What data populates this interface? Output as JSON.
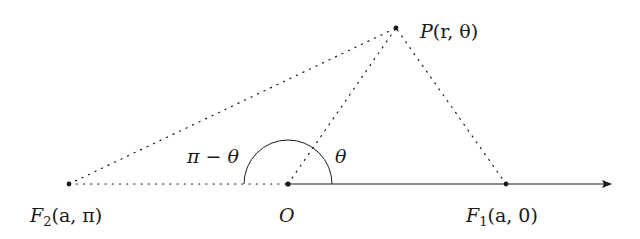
{
  "diagram": {
    "points": {
      "O": {
        "label": "O",
        "x": 288,
        "y": 184
      },
      "P": {
        "label_main": "P",
        "label_args": "(r, θ)",
        "x": 396,
        "y": 28
      },
      "F1": {
        "label_main": "F",
        "label_sub": "1",
        "label_args": "(a, 0)",
        "x": 506,
        "y": 184
      },
      "F2": {
        "label_main": "F",
        "label_sub": "2",
        "label_args": "(a, π)",
        "x": 69,
        "y": 184
      }
    },
    "angles": {
      "theta": "θ",
      "pi_minus_theta": "π − θ"
    },
    "axis": {
      "start_x": 288,
      "end_x": 612,
      "y": 184
    },
    "colors": {
      "ink": "#1a1a1a"
    }
  }
}
